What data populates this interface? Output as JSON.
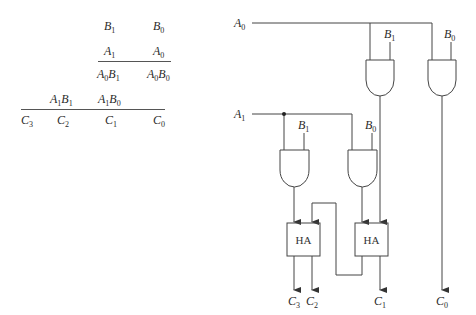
{
  "multiplication": {
    "row1": [
      {
        "v": "B",
        "s": "1"
      },
      {
        "v": "B",
        "s": "0"
      }
    ],
    "row2": [
      {
        "v": "A",
        "s": "1"
      },
      {
        "v": "A",
        "s": "0"
      }
    ],
    "row3": [
      {
        "v": "A",
        "s": "0",
        "v2": "B",
        "s2": "1"
      },
      {
        "v": "A",
        "s": "0",
        "v2": "B",
        "s2": "0"
      }
    ],
    "row4": [
      {
        "v": "A",
        "s": "1",
        "v2": "B",
        "s2": "1"
      },
      {
        "v": "A",
        "s": "1",
        "v2": "B",
        "s2": "0"
      }
    ],
    "result": [
      {
        "v": "C",
        "s": "3"
      },
      {
        "v": "C",
        "s": "2"
      },
      {
        "v": "C",
        "s": "1"
      },
      {
        "v": "C",
        "s": "0"
      }
    ]
  },
  "circuit": {
    "inputs": {
      "a0": {
        "v": "A",
        "s": "0"
      },
      "a1": {
        "v": "A",
        "s": "1"
      },
      "g1_b": {
        "v": "B",
        "s": "1"
      },
      "g2_b": {
        "v": "B",
        "s": "0"
      },
      "g3_b": {
        "v": "B",
        "s": "1"
      },
      "g4_b": {
        "v": "B",
        "s": "0"
      }
    },
    "half_adder_label": "HA",
    "outputs": [
      {
        "v": "C",
        "s": "3"
      },
      {
        "v": "C",
        "s": "2"
      },
      {
        "v": "C",
        "s": "1"
      },
      {
        "v": "C",
        "s": "0"
      }
    ]
  }
}
